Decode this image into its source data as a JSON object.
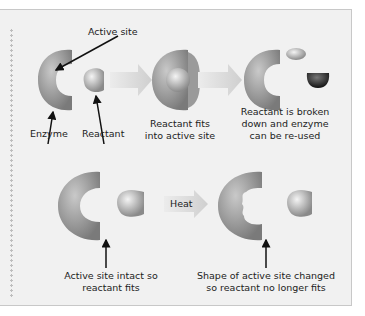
{
  "labels": {
    "active_site": "Active site",
    "enzyme": "Enzyme",
    "reactant": "Reactant",
    "fits_1": "Reactant fits",
    "fits_2": "into active site",
    "broken_1": "Reactant is broken",
    "broken_2": "down and enzyme",
    "broken_3": "can be re-used",
    "heat": "Heat",
    "intact_1": "Active site intact so",
    "intact_2": "reactant fits",
    "changed_1": "Shape of active site changed",
    "changed_2": "so reactant no longer fits"
  },
  "colors": {
    "panel_bg": "#f1f1f1",
    "enzyme": "#8e8e8e",
    "reactant": "#a8a8a8",
    "product_dark": "#333333",
    "arrow_fill": "#d6d6d6"
  }
}
